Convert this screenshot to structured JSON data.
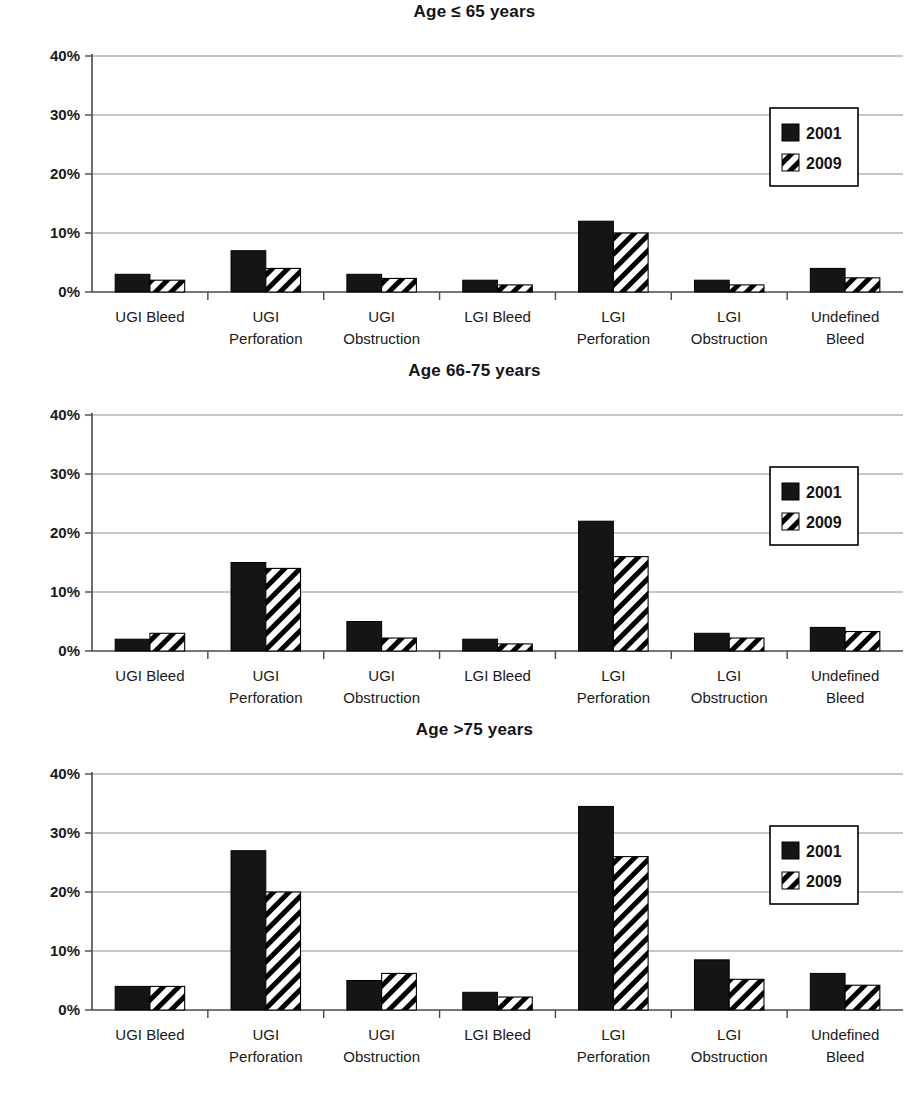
{
  "figure": {
    "series_names": [
      "2001",
      "2009"
    ],
    "y_ticks": [
      "0%",
      "10%",
      "20%",
      "30%",
      "40%"
    ],
    "categories_line1": [
      "UGI Bleed",
      "UGI",
      "UGI",
      "LGI Bleed",
      "LGI",
      "LGI",
      "Undefined"
    ],
    "categories_line2": [
      "",
      "Perforation",
      "Obstruction",
      "",
      "Perforation",
      "Obstruction",
      "Bleed"
    ],
    "legend": {
      "entry_2001": "2001",
      "entry_2009": "2009",
      "swatch_2001_name": "solid-black-swatch",
      "swatch_2009_name": "diagonal-hatch-swatch"
    },
    "colors": {
      "series_2001": "#151515",
      "series_2009_hatch": "#000000",
      "series_2009_bg": "#ffffff",
      "gridline": "#8f8f8f",
      "axis": "#4a4a4a",
      "text": "#141414"
    }
  },
  "panels": [
    {
      "title": "Age ≤ 65 years",
      "chart_data": {
        "type": "bar",
        "title": "Age ≤ 65 years",
        "xlabel": "",
        "ylabel": "",
        "ylim": [
          0,
          40
        ],
        "yticks": [
          0,
          10,
          20,
          30,
          40
        ],
        "ytick_labels": [
          "0%",
          "10%",
          "20%",
          "30%",
          "40%"
        ],
        "grid": true,
        "legend_position": "top-right",
        "categories": [
          "UGI Bleed",
          "UGI Perforation",
          "UGI Obstruction",
          "LGI Bleed",
          "LGI Perforation",
          "LGI Obstruction",
          "Undefined Bleed"
        ],
        "series": [
          {
            "name": "2001",
            "values": [
              3,
              7,
              3,
              2,
              12,
              2,
              4
            ]
          },
          {
            "name": "2009",
            "values": [
              2,
              4,
              2.3,
              1.2,
              10,
              1.2,
              2.4
            ]
          }
        ]
      }
    },
    {
      "title": "Age 66-75 years",
      "chart_data": {
        "type": "bar",
        "title": "Age 66-75 years",
        "xlabel": "",
        "ylabel": "",
        "ylim": [
          0,
          40
        ],
        "yticks": [
          0,
          10,
          20,
          30,
          40
        ],
        "ytick_labels": [
          "0%",
          "10%",
          "20%",
          "30%",
          "40%"
        ],
        "grid": true,
        "legend_position": "top-right",
        "categories": [
          "UGI Bleed",
          "UGI Perforation",
          "UGI Obstruction",
          "LGI Bleed",
          "LGI Perforation",
          "LGI Obstruction",
          "Undefined Bleed"
        ],
        "series": [
          {
            "name": "2001",
            "values": [
              2,
              15,
              5,
              2,
              22,
              3,
              4
            ]
          },
          {
            "name": "2009",
            "values": [
              3,
              14,
              2.2,
              1.2,
              16,
              2.2,
              3.3
            ]
          }
        ]
      }
    },
    {
      "title": "Age >75 years",
      "chart_data": {
        "type": "bar",
        "title": "Age >75 years",
        "xlabel": "",
        "ylabel": "",
        "ylim": [
          0,
          40
        ],
        "yticks": [
          0,
          10,
          20,
          30,
          40
        ],
        "ytick_labels": [
          "0%",
          "10%",
          "20%",
          "30%",
          "40%"
        ],
        "grid": true,
        "legend_position": "top-right",
        "categories": [
          "UGI Bleed",
          "UGI Perforation",
          "UGI Obstruction",
          "LGI Bleed",
          "LGI Perforation",
          "LGI Obstruction",
          "Undefined Bleed"
        ],
        "series": [
          {
            "name": "2001",
            "values": [
              4,
              27,
              5,
              3,
              34.5,
              8.5,
              6.2
            ]
          },
          {
            "name": "2009",
            "values": [
              4,
              20,
              6.2,
              2.2,
              26,
              5.2,
              4.2
            ]
          }
        ]
      }
    }
  ]
}
